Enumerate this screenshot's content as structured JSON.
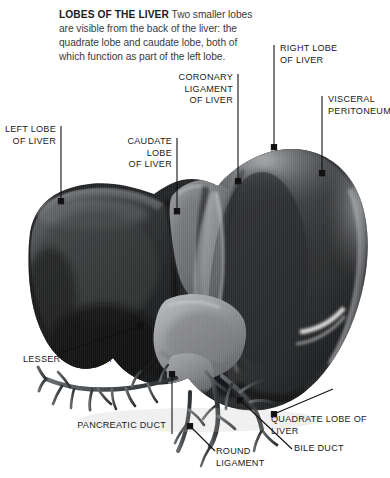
{
  "caption": {
    "lead": "LOBES OF THE LIVER",
    "body": "Two smaller lobes are visible from the back of the liver: the quadrate lobe and caudate lobe, both of which function as part of the left lobe."
  },
  "labels": {
    "left_lobe": "LEFT LOBE\nOF LIVER",
    "caudate_lobe": "CAUDATE LOBE\nOF LIVER",
    "coronary_ligament": "CORONARY\nLIGAMENT\nOF LIVER",
    "right_lobe": "RIGHT LOBE\nOF LIVER",
    "visceral_peritoneum": "VISCERAL\nPERITONEUM",
    "lesser_omentum": "LESSER OMENTUM",
    "pancreatic_duct": "PANCREATIC DUCT",
    "round_ligament": "ROUND\nLIGAMENT",
    "bile_duct": "BILE DUCT",
    "quadrate_lobe": "QUADRATE LOBE OF LIVER"
  },
  "figure": {
    "alt": "Grayscale photograph of a human liver seen from behind, showing the large right lobe, left lobe, caudate and quadrate lobes, with the biliary and pancreatic duct tree emerging below."
  },
  "colors": {
    "background": "#ffffff",
    "label_text": "#1a1a1a",
    "caption_text": "#3a3a3a",
    "caption_lead": "#1c1c1c",
    "leader_line": "#111111",
    "liver_dark": "#1f2021",
    "liver_mid": "#4a4b4d",
    "liver_light": "#8e9093",
    "liver_highlight": "#d8d9da",
    "duct_gray": "#55585b",
    "peritoneum_sheen": "#f2f2f2"
  }
}
